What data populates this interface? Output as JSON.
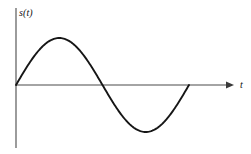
{
  "figure": {
    "name": "sine-wave-signal-plot",
    "background_color": "#ffffff",
    "curve_color": "#161616",
    "axis_color": "#4a4a4a"
  },
  "axes": {
    "y_label": "s(t)",
    "x_label": "t",
    "y_axis": {
      "x": 16,
      "top": 8,
      "bottom": 148
    },
    "x_axis": {
      "y": 85,
      "left": 16,
      "right": 234,
      "arrow": true
    }
  },
  "chart_data": {
    "type": "line",
    "title": "",
    "subtitle": "",
    "xlabel": "t",
    "ylabel": "s(t)",
    "grid": false,
    "legend": null,
    "axis_arrows": {
      "x": true,
      "y": false
    },
    "tick_labels": {
      "x": [],
      "y": []
    },
    "xlim": [
      0,
      1.26
    ],
    "ylim": [
      -1.15,
      1.15
    ],
    "series": [
      {
        "name": "s(t)",
        "function": "sin(2*pi*t)",
        "color": "#161616",
        "x": [
          0,
          0.0625,
          0.125,
          0.1875,
          0.25,
          0.3125,
          0.375,
          0.4375,
          0.5,
          0.5625,
          0.625,
          0.6875,
          0.75,
          0.8125,
          0.875,
          0.9375,
          1.0
        ],
        "values": [
          0,
          0.383,
          0.707,
          0.924,
          1.0,
          0.924,
          0.707,
          0.383,
          0,
          -0.383,
          -0.707,
          -0.924,
          -1.0,
          -0.924,
          -0.707,
          -0.383,
          0
        ]
      }
    ],
    "key_points": [
      {
        "label": "origin",
        "x": 0,
        "y": 0,
        "px": [
          16,
          85
        ]
      },
      {
        "label": "peak",
        "x": 0.25,
        "y": 1.0,
        "px": [
          60,
          38
        ]
      },
      {
        "label": "zero-crossing",
        "x": 0.5,
        "y": 0,
        "px": [
          104,
          85
        ]
      },
      {
        "label": "trough",
        "x": 0.75,
        "y": -1.0,
        "px": [
          147,
          132
        ]
      },
      {
        "label": "end",
        "x": 1.0,
        "y": 0,
        "px": [
          189,
          85
        ]
      }
    ]
  }
}
